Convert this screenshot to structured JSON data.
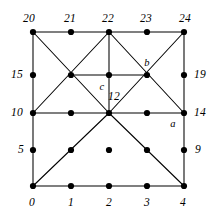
{
  "figure": {
    "background_color": "#ffffff",
    "line_color": "#000000",
    "vertex_color": "#000000",
    "grid": {
      "columns": 5,
      "rows": 5,
      "x_positions": [
        33,
        71,
        109,
        147,
        184
      ],
      "y_positions": [
        186,
        150,
        113,
        75,
        32
      ]
    },
    "vertices": [
      {
        "id": 0,
        "col": 0,
        "row": 0
      },
      {
        "id": 1,
        "col": 1,
        "row": 0
      },
      {
        "id": 2,
        "col": 2,
        "row": 0
      },
      {
        "id": 3,
        "col": 3,
        "row": 0
      },
      {
        "id": 4,
        "col": 4,
        "row": 0
      },
      {
        "id": 5,
        "col": 0,
        "row": 1
      },
      {
        "id": 6,
        "col": 1,
        "row": 1
      },
      {
        "id": 7,
        "col": 2,
        "row": 1
      },
      {
        "id": 8,
        "col": 3,
        "row": 1
      },
      {
        "id": 9,
        "col": 4,
        "row": 1
      },
      {
        "id": 10,
        "col": 0,
        "row": 2
      },
      {
        "id": 11,
        "col": 1,
        "row": 2
      },
      {
        "id": 12,
        "col": 2,
        "row": 2
      },
      {
        "id": 13,
        "col": 3,
        "row": 2
      },
      {
        "id": 14,
        "col": 4,
        "row": 2
      },
      {
        "id": 15,
        "col": 0,
        "row": 3
      },
      {
        "id": 16,
        "col": 1,
        "row": 3
      },
      {
        "id": 17,
        "col": 2,
        "row": 3
      },
      {
        "id": 18,
        "col": 3,
        "row": 3
      },
      {
        "id": 19,
        "col": 4,
        "row": 3
      },
      {
        "id": 20,
        "col": 0,
        "row": 4
      },
      {
        "id": 21,
        "col": 1,
        "row": 4
      },
      {
        "id": 22,
        "col": 2,
        "row": 4
      },
      {
        "id": 23,
        "col": 3,
        "row": 4
      },
      {
        "id": 24,
        "col": 4,
        "row": 4
      }
    ],
    "edges": [
      {
        "from": 0,
        "to": 4,
        "kind": "horizontal-bottom"
      },
      {
        "from": 20,
        "to": 24,
        "kind": "horizontal-top"
      },
      {
        "from": 10,
        "to": 14,
        "kind": "horizontal-middle"
      },
      {
        "from": 16,
        "to": 18,
        "kind": "horizontal-short"
      },
      {
        "from": 0,
        "to": 20,
        "kind": "vertical-left"
      },
      {
        "from": 4,
        "to": 24,
        "kind": "vertical-right"
      },
      {
        "from": 12,
        "to": 22,
        "kind": "vertical-center"
      },
      {
        "from": 20,
        "to": 12,
        "kind": "diagonal"
      },
      {
        "from": 10,
        "to": 22,
        "kind": "diagonal"
      },
      {
        "from": 22,
        "to": 14,
        "kind": "diagonal"
      },
      {
        "from": 12,
        "to": 24,
        "kind": "diagonal"
      },
      {
        "from": 12,
        "to": 0,
        "kind": "diagonal"
      },
      {
        "from": 12,
        "to": 4,
        "kind": "diagonal"
      }
    ],
    "labels": [
      {
        "id": "label-20",
        "text": "20",
        "x": 29,
        "y": 19,
        "anchor": "vertex-20"
      },
      {
        "id": "label-21",
        "text": "21",
        "x": 70,
        "y": 19,
        "anchor": "vertex-21"
      },
      {
        "id": "label-22",
        "text": "22",
        "x": 108,
        "y": 19,
        "anchor": "vertex-22"
      },
      {
        "id": "label-23",
        "text": "23",
        "x": 146,
        "y": 19,
        "anchor": "vertex-23"
      },
      {
        "id": "label-24",
        "text": "24",
        "x": 185,
        "y": 19,
        "anchor": "vertex-24"
      },
      {
        "id": "label-15",
        "text": "15",
        "x": 17,
        "y": 75,
        "anchor": "vertex-15"
      },
      {
        "id": "label-10",
        "text": "10",
        "x": 17,
        "y": 113,
        "anchor": "vertex-10"
      },
      {
        "id": "label-5",
        "text": "5",
        "x": 21,
        "y": 150,
        "anchor": "vertex-5"
      },
      {
        "id": "label-19",
        "text": "19",
        "x": 200,
        "y": 75,
        "anchor": "vertex-19"
      },
      {
        "id": "label-14",
        "text": "14",
        "x": 200,
        "y": 113,
        "anchor": "vertex-14"
      },
      {
        "id": "label-9",
        "text": "9",
        "x": 198,
        "y": 150,
        "anchor": "vertex-9"
      },
      {
        "id": "label-0",
        "text": "0",
        "x": 32,
        "y": 203,
        "anchor": "vertex-0"
      },
      {
        "id": "label-1",
        "text": "1",
        "x": 71,
        "y": 203,
        "anchor": "vertex-1"
      },
      {
        "id": "label-2",
        "text": "2",
        "x": 109,
        "y": 203,
        "anchor": "vertex-2"
      },
      {
        "id": "label-3",
        "text": "3",
        "x": 147,
        "y": 203,
        "anchor": "vertex-3"
      },
      {
        "id": "label-4",
        "text": "4",
        "x": 183,
        "y": 203,
        "anchor": "vertex-4"
      },
      {
        "id": "label-12",
        "text": "12",
        "x": 114,
        "y": 97,
        "anchor": "vertex-12"
      },
      {
        "id": "label-c",
        "text": "c",
        "x": 102,
        "y": 87,
        "anchor": "vertex-17"
      },
      {
        "id": "label-b",
        "text": "b",
        "x": 147,
        "y": 63,
        "anchor": "vertex-18"
      },
      {
        "id": "label-a",
        "text": "a",
        "x": 173,
        "y": 124,
        "anchor": "vertex-14"
      }
    ]
  }
}
